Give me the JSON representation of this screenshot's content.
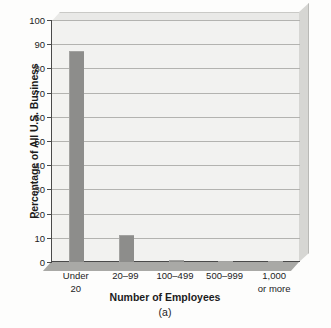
{
  "chart_data": {
    "type": "bar",
    "title": "",
    "subtitle": "(a)",
    "xlabel": "Number of Employees",
    "ylabel": "Percentage of All U.S. Business",
    "categories": [
      "Under\n20",
      "20–99",
      "100–499",
      "500–999",
      "1,000\nor more"
    ],
    "values": [
      87,
      11,
      0.8,
      0.4,
      0.1
    ],
    "ylim": [
      0,
      100
    ],
    "yticks": [
      0,
      10,
      20,
      30,
      40,
      50,
      60,
      70,
      80,
      90,
      100
    ],
    "ytick_labels": [
      "0",
      "10",
      "20",
      "30",
      "40",
      "50",
      "60",
      "70",
      "80",
      "90",
      "100"
    ],
    "grid": true,
    "legend": false,
    "legend_position": "none",
    "bar_color": "#8d8d8b",
    "plot_background": "#f2f2f0",
    "axis_color": "#4a4a4a",
    "gridline_color": "#b3b3b0"
  }
}
